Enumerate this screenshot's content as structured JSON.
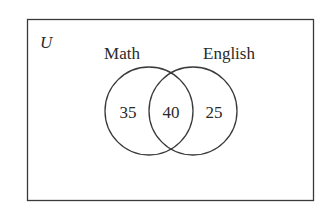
{
  "diagram": {
    "type": "venn",
    "universe_label": "U",
    "sets": [
      {
        "name": "Math",
        "only_value": "35"
      },
      {
        "name": "English",
        "only_value": "25"
      }
    ],
    "intersection_value": "40",
    "colors": {
      "stroke": "#3a3a3a",
      "text": "#2a2a2a",
      "background": "#ffffff"
    }
  }
}
